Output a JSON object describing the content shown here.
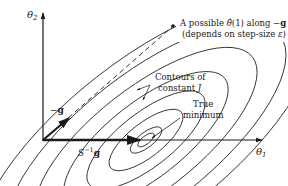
{
  "diagram": {
    "type": "gradient-descent-contour-diagram",
    "axes": {
      "x_label": "θ",
      "x_label_sub": "1",
      "y_label": "θ",
      "y_label_sub": "2"
    },
    "annotations": {
      "possible_estimate_line1_prefix": "A possible ",
      "possible_estimate_theta": "θ̂",
      "possible_estimate_line1_suffix": "(1) along −",
      "possible_estimate_g": "g",
      "possible_estimate_line2_prefix": "(depends on step-size ",
      "possible_estimate_epsilon": "ε",
      "possible_estimate_line2_suffix": ")",
      "contours_line1": "Contours of",
      "contours_line2_prefix": "constant ",
      "contours_J": "J",
      "true_min_line1": "True",
      "true_min_line2": "minimum",
      "neg_g_minus": "−",
      "neg_g_g": "g",
      "s_inv_g_S": "S",
      "s_inv_g_exp": "−1",
      "s_inv_g_g": "g"
    },
    "colors": {
      "ink": "#1a1a1a",
      "background": "#ffffff"
    }
  }
}
